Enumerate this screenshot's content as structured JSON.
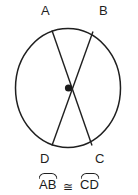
{
  "figure": {
    "type": "geometry-diagram",
    "shape": "circle-with-two-chords",
    "background_color": "#ffffff",
    "stroke_color": "#1f1f1f",
    "circle": {
      "center_x": 68,
      "center_y": 88,
      "radius_x": 53,
      "radius_y": 60,
      "center_point_label": "center-dot"
    },
    "points": [
      {
        "id": "A",
        "label": "A",
        "x": 52,
        "y": 31,
        "label_x": 41,
        "label_y": 4
      },
      {
        "id": "B",
        "label": "B",
        "x": 93,
        "y": 32,
        "label_x": 99,
        "label_y": 4
      },
      {
        "id": "C",
        "label": "C",
        "x": 92,
        "y": 145,
        "label_x": 95,
        "label_y": 152
      },
      {
        "id": "D",
        "label": "D",
        "x": 52,
        "y": 145,
        "label_x": 40,
        "label_y": 152
      }
    ],
    "chords": [
      {
        "id": "AC",
        "from": "A",
        "to": "C"
      },
      {
        "id": "BD",
        "from": "B",
        "to": "D"
      }
    ],
    "caption": {
      "arc_1": "AB",
      "relation": "≅",
      "arc_2": "CD",
      "full_text": "arc AB ≅ arc CD"
    }
  }
}
